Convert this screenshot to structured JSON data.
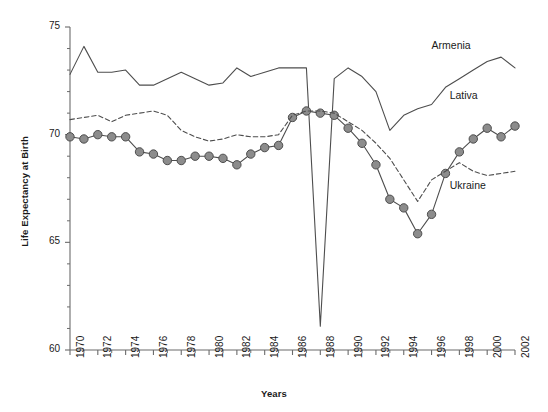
{
  "chart_data": {
    "type": "line",
    "title": "",
    "xlabel": "Years",
    "ylabel": "Life Expectancy at Birth",
    "xlim": [
      1970,
      2002
    ],
    "ylim": [
      60,
      75
    ],
    "yticks": [
      60,
      65,
      70,
      75
    ],
    "ytick_labels": [
      "60",
      "65",
      "70",
      "75"
    ],
    "xticks": [
      1970,
      1972,
      1974,
      1976,
      1978,
      1980,
      1982,
      1984,
      1986,
      1988,
      1990,
      1992,
      1994,
      1996,
      1998,
      2000,
      2002
    ],
    "xtick_labels": [
      "1970",
      "1972",
      "1974",
      "1976",
      "1978",
      "1980",
      "1982",
      "1984",
      "1986",
      "1988",
      "1990",
      "1992",
      "1994",
      "1996",
      "1998",
      "2000",
      "2002"
    ],
    "x_minor_tick_interval": 1,
    "grid": false,
    "legend_position": "inline-annotations",
    "x": [
      1970,
      1971,
      1972,
      1973,
      1974,
      1975,
      1976,
      1977,
      1978,
      1979,
      1980,
      1981,
      1982,
      1983,
      1984,
      1985,
      1986,
      1987,
      1988,
      1989,
      1990,
      1991,
      1992,
      1993,
      1994,
      1995,
      1996,
      1997,
      1998,
      1999,
      2000,
      2001,
      2002
    ],
    "series": [
      {
        "name": "Armenia",
        "style": "solid",
        "marker": "none",
        "color": "#4d4d4d",
        "values": [
          72.8,
          74.1,
          72.9,
          72.9,
          73.0,
          72.3,
          72.3,
          72.6,
          72.9,
          72.6,
          72.3,
          72.4,
          73.1,
          72.7,
          72.9,
          73.1,
          73.1,
          73.1,
          61.1,
          72.6,
          73.1,
          72.7,
          72.0,
          70.2,
          70.9,
          71.2,
          71.4,
          72.2,
          72.6,
          73.0,
          73.4,
          73.6,
          73.1
        ]
      },
      {
        "name": "Lativa",
        "style": "solid",
        "marker": "circle",
        "color": "#4d4d4d",
        "marker_fill": "#8c8c8c",
        "values": [
          69.9,
          69.8,
          70.0,
          69.9,
          69.9,
          69.2,
          69.1,
          68.8,
          68.8,
          69.0,
          69.0,
          68.9,
          68.6,
          69.1,
          69.4,
          69.5,
          70.8,
          71.1,
          71.0,
          70.9,
          70.3,
          69.6,
          68.6,
          67.0,
          66.6,
          65.4,
          66.3,
          68.2,
          69.2,
          69.8,
          70.3,
          69.9,
          70.4
        ]
      },
      {
        "name": "Ukraine",
        "style": "dashed",
        "marker": "none",
        "color": "#4d4d4d",
        "values": [
          70.7,
          70.8,
          70.9,
          70.6,
          70.9,
          71.0,
          71.1,
          70.9,
          70.2,
          69.9,
          69.7,
          69.8,
          70.0,
          69.9,
          69.9,
          70.0,
          70.9,
          71.1,
          71.1,
          71.0,
          70.6,
          70.2,
          69.6,
          68.9,
          67.9,
          66.9,
          67.9,
          68.3,
          68.7,
          68.3,
          68.1,
          68.2,
          68.3
        ]
      }
    ],
    "annotations": [
      {
        "text": "Armenia",
        "x": 1996,
        "y": 74.1
      },
      {
        "text": "Lativa",
        "x": 1997.3,
        "y": 71.8
      },
      {
        "text": "Ukraine",
        "x": 1997.3,
        "y": 67.6
      }
    ]
  }
}
